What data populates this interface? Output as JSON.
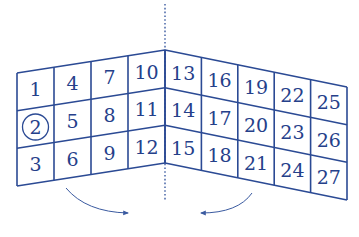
{
  "diagram": {
    "colors": {
      "line": "#2b4a94",
      "text": "#25408a",
      "arrow": "#3a5aa0",
      "fold_line": "#3a5aa0"
    },
    "left_panel": {
      "columns": [
        [
          "1",
          "2",
          "3"
        ],
        [
          "4",
          "5",
          "6"
        ],
        [
          "7",
          "8",
          "9"
        ],
        [
          "10",
          "11",
          "12"
        ]
      ]
    },
    "right_panel": {
      "columns": [
        [
          "13",
          "14",
          "15"
        ],
        [
          "16",
          "17",
          "18"
        ],
        [
          "19",
          "20",
          "21"
        ],
        [
          "22",
          "23",
          "24"
        ],
        [
          "25",
          "26",
          "27"
        ]
      ]
    },
    "circled_number": "2",
    "arrows": [
      {
        "name": "left-fold-arrow",
        "direction": "right"
      },
      {
        "name": "right-fold-arrow",
        "direction": "left"
      }
    ]
  }
}
